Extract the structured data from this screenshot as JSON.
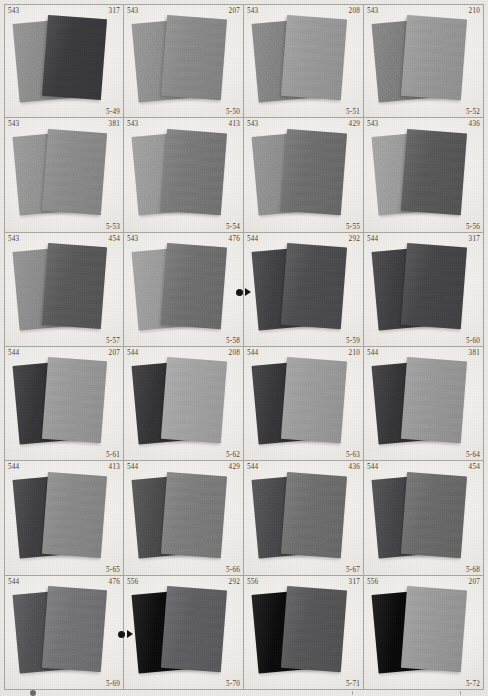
{
  "page": {
    "kind": "color-swatch-catalog-page",
    "columns": 4,
    "rows": 6,
    "background_color": "#eceae6",
    "cell_background_color": "#f2f0ed",
    "border_color": "#a9a6a0",
    "label_color": "#45423e"
  },
  "cells": [
    {
      "plate": "5-49",
      "code_left": "543",
      "code_right": "317",
      "back_color": "#8d8d8d",
      "front_color": "#3a3a3c"
    },
    {
      "plate": "5-50",
      "code_left": "543",
      "code_right": "207",
      "back_color": "#909090",
      "front_color": "#8a8a8a"
    },
    {
      "plate": "5-51",
      "code_left": "543",
      "code_right": "208",
      "back_color": "#838383",
      "front_color": "#9b9b9b"
    },
    {
      "plate": "5-52",
      "code_left": "543",
      "code_right": "210",
      "back_color": "#7e7e7e",
      "front_color": "#9a9a9a"
    },
    {
      "plate": "5-53",
      "code_left": "543",
      "code_right": "381",
      "back_color": "#949494",
      "front_color": "#8c8c8c"
    },
    {
      "plate": "5-54",
      "code_left": "543",
      "code_right": "413",
      "back_color": "#9a9a9a",
      "front_color": "#787878"
    },
    {
      "plate": "5-55",
      "code_left": "543",
      "code_right": "429",
      "back_color": "#8f8f8f",
      "front_color": "#6d6d6d"
    },
    {
      "plate": "5-56",
      "code_left": "543",
      "code_right": "436",
      "back_color": "#9d9d9d",
      "front_color": "#585858"
    },
    {
      "plate": "5-57",
      "code_left": "543",
      "code_right": "454",
      "back_color": "#8c8c8c",
      "front_color": "#585858"
    },
    {
      "plate": "5-58",
      "code_left": "543",
      "code_right": "476",
      "back_color": "#9c9c9c",
      "front_color": "#6f6f6f"
    },
    {
      "plate": "5-59",
      "code_left": "544",
      "code_right": "292",
      "back_color": "#3e3e40",
      "front_color": "#4c4c4e"
    },
    {
      "plate": "5-60",
      "code_left": "544",
      "code_right": "317",
      "back_color": "#3c3c3e",
      "front_color": "#454547"
    },
    {
      "plate": "5-61",
      "code_left": "544",
      "code_right": "207",
      "back_color": "#343436",
      "front_color": "#9a9a9a"
    },
    {
      "plate": "5-62",
      "code_left": "544",
      "code_right": "208",
      "back_color": "#313133",
      "front_color": "#a4a4a4"
    },
    {
      "plate": "5-63",
      "code_left": "544",
      "code_right": "210",
      "back_color": "#343436",
      "front_color": "#9d9d9d"
    },
    {
      "plate": "5-64",
      "code_left": "544",
      "code_right": "381",
      "back_color": "#333335",
      "front_color": "#9a9a9a"
    },
    {
      "plate": "5-65",
      "code_left": "544",
      "code_right": "413",
      "back_color": "#3d3d3f",
      "front_color": "#8a8a8a"
    },
    {
      "plate": "5-66",
      "code_left": "544",
      "code_right": "429",
      "back_color": "#494949",
      "front_color": "#7d7d7d"
    },
    {
      "plate": "5-67",
      "code_left": "544",
      "code_right": "436",
      "back_color": "#474749",
      "front_color": "#6e6e6e"
    },
    {
      "plate": "5-68",
      "code_left": "544",
      "code_right": "454",
      "back_color": "#434345",
      "front_color": "#6a6a6a"
    },
    {
      "plate": "5-69",
      "code_left": "544",
      "code_right": "476",
      "back_color": "#4e4e50",
      "front_color": "#737375"
    },
    {
      "plate": "5-70",
      "code_left": "556",
      "code_right": "292",
      "back_color": "#0a0a0a",
      "front_color": "#5e5e60"
    },
    {
      "plate": "5-71",
      "code_left": "556",
      "code_right": "317",
      "back_color": "#090909",
      "front_color": "#555557"
    },
    {
      "plate": "5-72",
      "code_left": "556",
      "code_right": "207",
      "back_color": "#070707",
      "front_color": "#9b9b9b"
    }
  ],
  "markers": [
    {
      "name": "registration-marker-row3",
      "dot": "●",
      "arrow": "▶",
      "color": "#15120f"
    },
    {
      "name": "registration-marker-row6",
      "dot": "●",
      "arrow": "▶",
      "color": "#15120f"
    }
  ]
}
